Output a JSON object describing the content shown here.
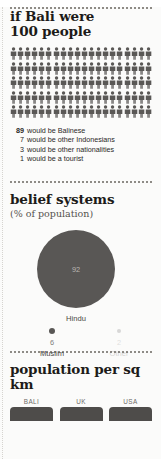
{
  "pictogram_section": {
    "title_line1": "if Bali were",
    "title_line2": "100 people",
    "total_figures": 100,
    "columns": 20,
    "rows": 5,
    "figure_color": "#5a5856",
    "legend": [
      {
        "count": "89",
        "text": "would be Balinese"
      },
      {
        "count": "7",
        "text": "would be other Indonesians"
      },
      {
        "count": "3",
        "text": "would be other nationalities"
      },
      {
        "count": "1",
        "text": "would be a tourist"
      }
    ]
  },
  "belief_section": {
    "title": "belief systems",
    "subtitle": "(% of population)",
    "chart_data": {
      "type": "pie",
      "title": "belief systems",
      "subtitle": "(% of population)",
      "unit": "% of population",
      "categories": [
        "Hindu",
        "Muslim",
        "Other"
      ],
      "values": [
        92,
        6,
        2
      ],
      "labels": [
        "92",
        "6",
        "2"
      ],
      "legend_position": "below-bubbles",
      "grid": false,
      "bubble_color": "#595755"
    },
    "hindu": {
      "label": "Hindu",
      "value": "92"
    },
    "muslim": {
      "label": "Muslim",
      "value": "6"
    },
    "other": {
      "label": "Other",
      "value": "2"
    }
  },
  "population_section": {
    "title": "population per sq km",
    "chart_data": {
      "type": "bar",
      "title": "population per sq km",
      "categories": [
        "BALI",
        "UK",
        "USA"
      ],
      "values": [
        null,
        null,
        null
      ],
      "xlabel": "",
      "ylabel": "population per sq km",
      "grid": false,
      "note": "bars cropped at bottom edge of screenshot"
    },
    "bars": [
      {
        "label": "BALI"
      },
      {
        "label": "UK"
      },
      {
        "label": "USA"
      }
    ]
  }
}
